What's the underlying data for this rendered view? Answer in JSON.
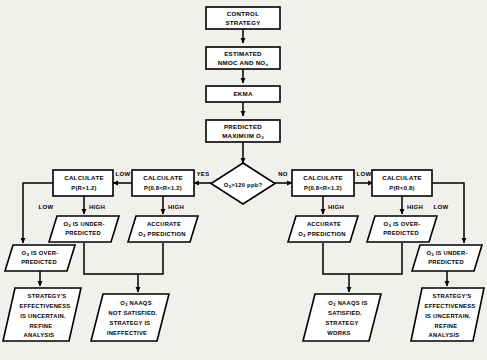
{
  "diagram": {
    "background_color": "#f2f0ec",
    "line_color": "#000000",
    "node_fill": "#ffffff",
    "nodes": {
      "control_strategy": {
        "line1": "CONTROL",
        "line2": "STRATEGY"
      },
      "estimated": {
        "line1": "ESTIMATED",
        "line2_a": "NMOC AND NO",
        "line2_sub": "x"
      },
      "ekma": {
        "line1": "EKMA"
      },
      "predicted_max": {
        "line1": "PREDICTED",
        "line2_a": "MAXIMUM O",
        "line2_sub": "3"
      },
      "decision": {
        "a": "O",
        "sub": "3",
        "b": ">120 ppb?"
      },
      "calc_l1": {
        "line1": "CALCULATE",
        "line2": "P(R>1.2)"
      },
      "calc_l2": {
        "line1": "CALCULATE",
        "line2": "P(0.8<R<1.2)"
      },
      "calc_r1": {
        "line1": "CALCULATE",
        "line2": "P(0.8<R<1.2)"
      },
      "calc_r2": {
        "line1": "CALCULATE",
        "line2": "P(R<0.8)"
      },
      "para_l_under": {
        "a": "O",
        "sub": "3",
        "b": " IS UNDER-",
        "line2": "PREDICTED"
      },
      "para_l_accurate": {
        "line1": "ACCURATE",
        "a": "O",
        "sub": "3",
        "b": " PREDICTION"
      },
      "para_r_accurate": {
        "line1": "ACCURATE",
        "a": "O",
        "sub": "3",
        "b": " PREDICTION"
      },
      "para_r_over": {
        "a": "O",
        "sub": "3",
        "b": " IS OVER-",
        "line2": "PREDICTED"
      },
      "para_far_left_over": {
        "a": "O",
        "sub": "3",
        "b": " IS OVER-",
        "line2": "PREDICTED"
      },
      "para_far_right_under": {
        "a": "O",
        "sub": "3",
        "b": " IS UNDER-",
        "line2": "PREDICTED"
      },
      "out_left_uncertain": {
        "line1": "STRATEGY'S",
        "line2": "EFFECTIVENESS",
        "line3": "IS UNCERTAIN.",
        "line4": "REFINE",
        "line5": "ANALYSIS"
      },
      "out_naaqs_not": {
        "a": "O",
        "sub": "3",
        "b": " NAAQS",
        "line2": "NOT SATISFIED.",
        "line3": "STRATEGY IS",
        "line4": "INEFFECTIVE"
      },
      "out_naaqs_yes": {
        "a": "O",
        "sub": "3",
        "b": " NAAQS IS",
        "line2": "SATISFIED.",
        "line3": "STRATEGY",
        "line4": "WORKS"
      },
      "out_right_uncertain": {
        "line1": "STRATEGY'S",
        "line2": "EFFECTIVENESS",
        "line3": "IS UNCERTAIN.",
        "line4": "REFINE",
        "line5": "ANALYSIS"
      }
    },
    "edge_labels": {
      "yes": "YES",
      "no": "NO",
      "low_l_from_l2": "LOW",
      "low_l_outer": "LOW",
      "high_l1": "HIGH",
      "high_l2": "HIGH",
      "low_r_from_r1": "LOW",
      "low_r_outer": "LOW",
      "high_r1": "HIGH",
      "high_r2": "HIGH"
    }
  }
}
